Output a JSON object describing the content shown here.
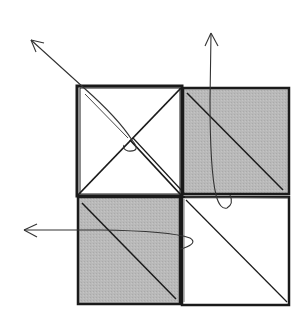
{
  "diagram": {
    "title": "",
    "colors": {
      "stroke": "#1a1a1a",
      "shade": "#b8b8b8",
      "paper": "#ffffff",
      "arrow": "#333333"
    },
    "quadrants": [
      {
        "id": "top-left",
        "fill": "white",
        "creases": [
          "diagonal-tl-br",
          "diagonal-tr-bl"
        ]
      },
      {
        "id": "top-right",
        "fill": "gray",
        "creases": [
          "diagonal-tl-br"
        ]
      },
      {
        "id": "bottom-left",
        "fill": "gray",
        "creases": [
          "diagonal-tl-br"
        ]
      },
      {
        "id": "bottom-right",
        "fill": "white",
        "creases": [
          "diagonal-tl-br"
        ]
      }
    ],
    "arrows": [
      {
        "id": "diagonal-fold-arrow",
        "direction": "up-left"
      },
      {
        "id": "vertical-fold-arrow",
        "direction": "up"
      },
      {
        "id": "horizontal-fold-arrow",
        "direction": "left"
      }
    ]
  }
}
